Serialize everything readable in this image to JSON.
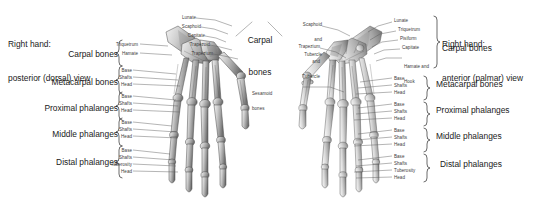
{
  "figure": {
    "background_color": "#ffffff",
    "bone_color": "#b9b9b9",
    "leader_color": "#5a5a5a",
    "text_color": "#231f20"
  },
  "left_panel": {
    "title_line1": "Right hand:",
    "title_line2": "posterior (dorsal) view",
    "view_name": "posterior (dorsal)",
    "groups": [
      {
        "label": "Carpal bones",
        "parts": [
          "Triquetrum",
          "Hamate"
        ]
      },
      {
        "label": "Metacarpal bones",
        "parts": [
          "Base",
          "Shafts",
          "Head"
        ]
      },
      {
        "label": "Proximal phalanges",
        "parts": [
          "Base",
          "Shafts",
          "Head"
        ]
      },
      {
        "label": "Middle phalanges",
        "parts": [
          "Base",
          "Shafts",
          "Head"
        ]
      },
      {
        "label": "Distal phalanges",
        "parts": [
          "Base",
          "Shafts",
          "Tuberosity",
          "Head"
        ]
      }
    ],
    "carpal_callouts": [
      "Lunate",
      "Scaphoid",
      "Capitate",
      "Trapezoid",
      "Trapezium"
    ]
  },
  "center": {
    "carpal_bones_line1": "Carpal",
    "carpal_bones_line2": "bones"
  },
  "right_panel": {
    "title_line1": "Right hand:",
    "title_line2": "anterior (palmar) view",
    "view_name": "anterior (palmar)",
    "groups": [
      {
        "label": "Carpal bones",
        "parts": []
      },
      {
        "label": "Metacarpal bones",
        "parts": [
          "Base",
          "Shafts",
          "Head"
        ]
      },
      {
        "label": "Proximal phalanges",
        "parts": [
          "Base",
          "Shafts",
          "Head"
        ]
      },
      {
        "label": "Middle phalanges",
        "parts": [
          "Base",
          "Shafts",
          "Head"
        ]
      },
      {
        "label": "Distal phalanges",
        "parts": [
          "Base",
          "Shafts",
          "Tuberosity",
          "Head"
        ]
      }
    ],
    "left_callouts": [
      {
        "lines": [
          "Scaphoid",
          "and",
          "Tubercle"
        ]
      },
      {
        "lines": [
          "Trapezium",
          "and",
          "Tubercle"
        ]
      },
      {
        "lines": [
          "Sesamoid",
          "bones"
        ]
      }
    ],
    "right_callouts": [
      {
        "lines": [
          "Lunate"
        ]
      },
      {
        "lines": [
          "Triquetrum"
        ]
      },
      {
        "lines": [
          "Pisiform"
        ]
      },
      {
        "lines": [
          "Capitate"
        ]
      },
      {
        "lines": [
          "Hamate and",
          "Hook"
        ]
      }
    ]
  }
}
